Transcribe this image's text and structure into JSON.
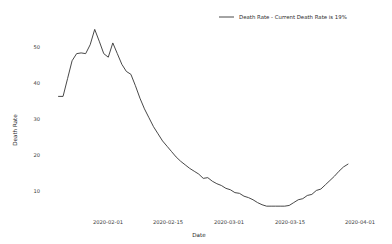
{
  "chart_data": {
    "type": "line",
    "title": "",
    "xlabel": "Date",
    "ylabel": "Death Rate",
    "grid": false,
    "legend_position": "top-right",
    "legend_entries": [
      "Death Rate - Current Death Rate is 19%"
    ],
    "series_name": "Death Rate - Current Death Rate is 19%",
    "series_color": "#333333",
    "ylim": [
      5,
      60
    ],
    "yticks": [
      10,
      20,
      30,
      40,
      50
    ],
    "ytick_labels": [
      "10",
      "20",
      "30",
      "40",
      "50"
    ],
    "xlim": [
      "2020-01-27",
      "2020-04-01"
    ],
    "xticks": [
      "2020-02-01",
      "2020-02-15",
      "2020-03-01",
      "2020-03-15",
      "2020-04-01"
    ],
    "xtick_labels": [
      "2020-02-01",
      "2020-02-15",
      "2020-03-01",
      "2020-03-15",
      "2020-04-01"
    ],
    "x": [
      "2020-01-28",
      "2020-01-29",
      "2020-01-30",
      "2020-01-31",
      "2020-02-01",
      "2020-02-02",
      "2020-02-03",
      "2020-02-04",
      "2020-02-05",
      "2020-02-06",
      "2020-02-07",
      "2020-02-08",
      "2020-02-09",
      "2020-02-10",
      "2020-02-11",
      "2020-02-12",
      "2020-02-13",
      "2020-02-14",
      "2020-02-15",
      "2020-02-16",
      "2020-02-17",
      "2020-02-18",
      "2020-02-19",
      "2020-02-20",
      "2020-02-21",
      "2020-02-22",
      "2020-02-23",
      "2020-02-24",
      "2020-02-25",
      "2020-02-26",
      "2020-02-27",
      "2020-02-28",
      "2020-02-29",
      "2020-03-01",
      "2020-03-02",
      "2020-03-03",
      "2020-03-04",
      "2020-03-05",
      "2020-03-06",
      "2020-03-07",
      "2020-03-08",
      "2020-03-09",
      "2020-03-10",
      "2020-03-11",
      "2020-03-12",
      "2020-03-13",
      "2020-03-14",
      "2020-03-15",
      "2020-03-16",
      "2020-03-17",
      "2020-03-18",
      "2020-03-19",
      "2020-03-20",
      "2020-03-21",
      "2020-03-22",
      "2020-03-23",
      "2020-03-24",
      "2020-03-25",
      "2020-03-26"
    ],
    "values": [
      38.0,
      38.0,
      43.0,
      48.0,
      50.0,
      50.2,
      50.0,
      52.5,
      56.8,
      53.5,
      50.0,
      49.0,
      53.0,
      50.0,
      47.0,
      45.0,
      44.2,
      41.0,
      37.5,
      34.5,
      32.0,
      29.5,
      27.5,
      25.5,
      24.0,
      22.5,
      21.0,
      19.8,
      18.8,
      17.8,
      17.0,
      16.2,
      15.0,
      15.2,
      14.2,
      13.5,
      13.0,
      12.2,
      11.8,
      11.0,
      10.8,
      10.0,
      9.6,
      9.0,
      8.2,
      7.6,
      7.2,
      7.2,
      7.2,
      7.2,
      7.2,
      7.4,
      8.2,
      9.0,
      9.3,
      10.2,
      10.5,
      11.6,
      12.0
    ],
    "tail_values": [
      13.2,
      14.4,
      15.6,
      17.0,
      18.2,
      19.0
    ],
    "tail_x": [
      "2020-03-27",
      "2020-03-28",
      "2020-03-29",
      "2020-03-30",
      "2020-03-31",
      "2020-04-01"
    ],
    "current_value": 19,
    "current_value_label": "19%",
    "peak_value": 56.8,
    "min_value": 7.2
  },
  "legend": {
    "label": "Death Rate - Current Death Rate is 19%"
  },
  "axes": {
    "x_title": "Date",
    "y_title": "Death Rate"
  }
}
